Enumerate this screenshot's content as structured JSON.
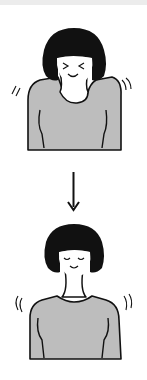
{
  "illustration": {
    "description": "Shoulder relaxation exercise: shoulders raised tensely, then lowered and relaxed",
    "steps": [
      {
        "state": "shoulders-raised",
        "expression": "squeezed-eyes-smile"
      },
      {
        "state": "shoulders-relaxed",
        "expression": "closed-eyes-calm-smile"
      }
    ],
    "arrow": "down-arrow"
  },
  "colors": {
    "background": "#ffffff",
    "top_strip": "#ececec",
    "hair": "#111111",
    "shirt": "#bdbdbd",
    "outline": "#111111",
    "skin": "#ffffff"
  }
}
